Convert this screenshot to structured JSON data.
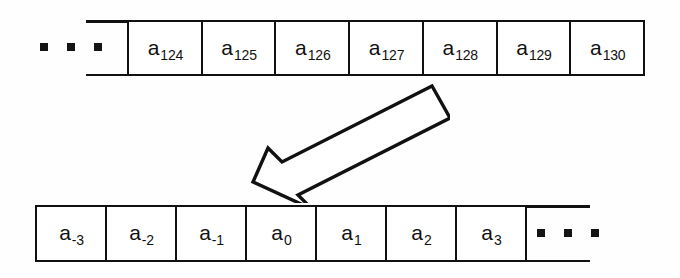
{
  "diagram": {
    "background_color": "#fefefe",
    "line_color": "#111111",
    "rows": [
      {
        "name": "source-array",
        "ellipsis_side": "left",
        "ellipsis_dots": 3,
        "cells": [
          {
            "base": "a",
            "subscript": "124"
          },
          {
            "base": "a",
            "subscript": "125"
          },
          {
            "base": "a",
            "subscript": "126"
          },
          {
            "base": "a",
            "subscript": "127"
          },
          {
            "base": "a",
            "subscript": "128"
          },
          {
            "base": "a",
            "subscript": "129"
          },
          {
            "base": "a",
            "subscript": "130"
          }
        ]
      },
      {
        "name": "target-array",
        "ellipsis_side": "right",
        "ellipsis_dots": 3,
        "cells": [
          {
            "base": "a",
            "subscript": "-3"
          },
          {
            "base": "a",
            "subscript": "-2"
          },
          {
            "base": "a",
            "subscript": "-1"
          },
          {
            "base": "a",
            "subscript": "0"
          },
          {
            "base": "a",
            "subscript": "1"
          },
          {
            "base": "a",
            "subscript": "2"
          },
          {
            "base": "a",
            "subscript": "3"
          }
        ]
      }
    ],
    "arrow": {
      "name": "mapping-arrow",
      "style": "hollow-block-arrow",
      "direction": "down-left",
      "fill": "#ffffff",
      "stroke": "#111111"
    }
  }
}
